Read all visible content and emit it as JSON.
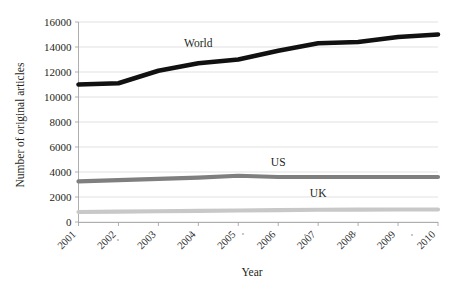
{
  "chart_data": {
    "type": "line",
    "title": "",
    "xlabel": "Year",
    "ylabel": "Number of original articles",
    "x": [
      "2001",
      "2002",
      "2003",
      "2004",
      "2005",
      "2006",
      "2007",
      "2008",
      "2009",
      "2010"
    ],
    "categories": [
      "2001",
      "2002",
      "2003",
      "2004",
      "2005",
      "2006",
      "2007",
      "2008",
      "2009",
      "2010"
    ],
    "xlim": [
      2001,
      2010
    ],
    "ylim": [
      0,
      16000
    ],
    "yticks": [
      "0",
      "2000",
      "4000",
      "6000",
      "8000",
      "10000",
      "12000",
      "14000",
      "16000"
    ],
    "ytick_values": [
      0,
      2000,
      4000,
      6000,
      8000,
      10000,
      12000,
      14000,
      16000
    ],
    "grid": true,
    "legend_position": "inline-labels",
    "series": [
      {
        "name": "World",
        "color": "#111111",
        "width": 4.6,
        "label_x": "2004",
        "label_value": 14000,
        "values": [
          11000,
          11100,
          12100,
          12700,
          13000,
          13700,
          14300,
          14400,
          14800,
          15000
        ]
      },
      {
        "name": "US",
        "color": "#7f7f7f",
        "width": 4.2,
        "label_x": "2006",
        "label_value": 4500,
        "values": [
          3250,
          3350,
          3450,
          3550,
          3700,
          3600,
          3600,
          3600,
          3600,
          3600
        ]
      },
      {
        "name": "UK",
        "color": "#c8c8c8",
        "width": 4.2,
        "label_x": "2007",
        "label_value": 2000,
        "values": [
          800,
          830,
          860,
          890,
          920,
          950,
          980,
          990,
          1000,
          1000
        ]
      }
    ]
  },
  "axes": {
    "y_title": "Number of original articles",
    "x_title": "Year"
  }
}
